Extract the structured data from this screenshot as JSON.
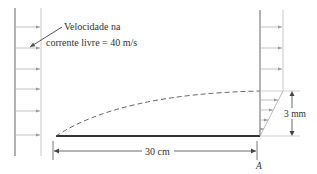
{
  "diagram": {
    "type": "flat-plate boundary layer",
    "labels": {
      "freestream_line1": "Velocidade na",
      "freestream_line2": "corrente livre = 40 m/s",
      "plate_length": "30 cm",
      "bl_thickness": "3 mm",
      "point": "A"
    },
    "values": {
      "freestream_velocity_mps": 40,
      "plate_length_cm": 30,
      "boundary_layer_thickness_mm": 3
    },
    "colors": {
      "line": "#555555",
      "plate": "#333333",
      "text": "#333333"
    }
  }
}
